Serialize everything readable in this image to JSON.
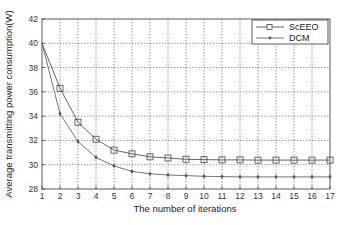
{
  "chart_data": {
    "type": "line",
    "title": "",
    "xlabel": "The number of iterations",
    "ylabel": "Average transmitting power consumption(W)",
    "xlim": [
      1,
      17
    ],
    "ylim": [
      28,
      42
    ],
    "x_ticks": [
      1,
      2,
      3,
      4,
      5,
      6,
      7,
      8,
      9,
      10,
      11,
      12,
      13,
      14,
      15,
      16,
      17
    ],
    "y_ticks": [
      28,
      30,
      32,
      34,
      36,
      38,
      40,
      42
    ],
    "grid": true,
    "legend_position": "top-right",
    "x": [
      1,
      2,
      3,
      4,
      5,
      6,
      7,
      8,
      9,
      10,
      11,
      12,
      13,
      14,
      15,
      16,
      17
    ],
    "series": [
      {
        "name": "ScEEO",
        "marker": "square",
        "color": "#555555",
        "values": [
          40.0,
          36.3,
          33.5,
          32.1,
          31.2,
          30.9,
          30.65,
          30.55,
          30.45,
          30.42,
          30.4,
          30.4,
          30.38,
          30.38,
          30.38,
          30.38,
          30.38
        ]
      },
      {
        "name": "DCM",
        "marker": "dot",
        "color": "#666666",
        "values": [
          40.0,
          34.2,
          31.9,
          30.6,
          29.9,
          29.45,
          29.25,
          29.15,
          29.1,
          29.05,
          29.02,
          29.0,
          29.0,
          29.0,
          29.0,
          29.0,
          29.0
        ]
      }
    ]
  }
}
